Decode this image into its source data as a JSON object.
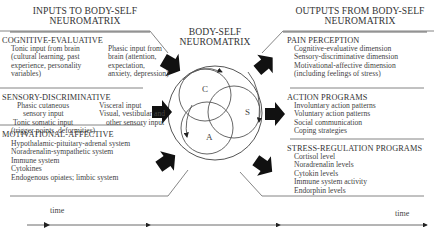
{
  "inputs": {
    "title_line1": "INPUTS TO BODY-SELF",
    "title_line2": "NEUROMATRIX",
    "sections": [
      {
        "heading": "COGNITIVE-EVALUATIVE",
        "col1": [
          "Tonic input from brain",
          "(cultural learning, past",
          "experience, personality",
          "variables)"
        ],
        "col2": [
          "Phasic input from",
          "brain (attention,",
          "expectation,",
          "anxiety, depression)"
        ]
      },
      {
        "heading": "SENSORY-DISCRIMINATIVE",
        "col1": [
          "Phasic cutaneous",
          "sensory input",
          "Tonic somatic input",
          "(trigger points, deformities)"
        ],
        "col2": [
          "Visceral input",
          "Visual, vestibular and",
          "other sensory input"
        ]
      },
      {
        "heading": "MOTIVATIONAL-AFFECTIVE",
        "items": [
          "Hypothalamic-pituitary-adrenal system",
          "Noradrenalin-sympathetic system",
          "Immune system",
          "Cytokines",
          "Endogenous opiates; limbic system"
        ]
      }
    ]
  },
  "neuromatrix": {
    "title_line1": "BODY-SELF",
    "title_line2": "NEUROMATRIX",
    "circle_labels": [
      "C",
      "S",
      "A"
    ]
  },
  "outputs": {
    "title_line1": "OUTPUTS FROM BODY-SELF",
    "title_line2": "NEUROMATRIX",
    "sections": [
      {
        "heading": "PAIN PERCEPTION",
        "items": [
          "Cognitive-evaluative dimension",
          "Sensory-discriminative dimension",
          "Motivational-affective dimension",
          "(including feelings of stress)"
        ]
      },
      {
        "heading": "ACTION PROGRAMS",
        "items": [
          "Involuntary action patterns",
          "Voluntary action patterns",
          "Social communication",
          "Coping strategies"
        ]
      },
      {
        "heading": "STRESS-REGULATION PROGRAMS",
        "items": [
          "Cortisol level",
          "Noradrenalin levels",
          "Cytokin levels",
          "Immune system activity",
          "Endorphin levels"
        ]
      }
    ]
  },
  "timeline": {
    "left_label": "time",
    "right_label": "time"
  },
  "colors": {
    "line": "#555555",
    "arrow": "#111111",
    "text": "#333333"
  }
}
